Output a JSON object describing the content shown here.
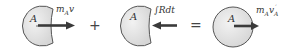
{
  "diagram": {
    "type": "impulse-momentum",
    "colors": {
      "disk_fill": "#e6e6e6",
      "disk_stroke": "#555555",
      "arrow": "#3a3a3a",
      "text": "#333333"
    },
    "terms": [
      {
        "body_label": "A",
        "vector_label_main": "m",
        "vector_label_sub": "A",
        "vector_label_v": "v",
        "direction": "right"
      },
      {
        "body_label": "A",
        "vector_label": "∫Rdt",
        "direction": "left"
      },
      {
        "body_label": "A",
        "vector_label_main": "m",
        "vector_label_sub": "A",
        "vector_label_v": "v",
        "vector_label_v_sub": "A",
        "vector_label_prime": "′",
        "direction": "right"
      }
    ],
    "operators": [
      "+",
      "="
    ]
  }
}
